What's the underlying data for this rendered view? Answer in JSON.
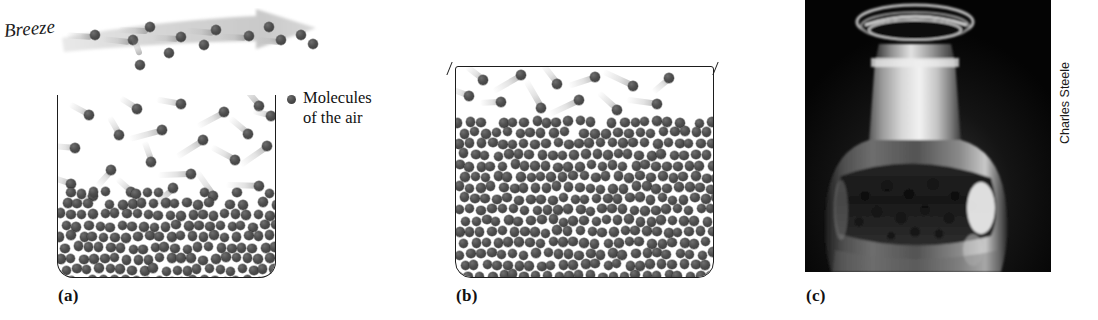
{
  "figure": {
    "background_color": "#ffffff",
    "molecule_color": "#4a4a4a",
    "outline_color": "#1d1d1d",
    "trail_color": "#b4b4b4"
  },
  "breeze": {
    "label": "Breeze",
    "arrow_direction": "right",
    "arrow_color": "#d2d2d2"
  },
  "legend": {
    "marker": "molecule-dot",
    "text": "Molecules\nof the air"
  },
  "panels": [
    {
      "id": "a",
      "label": "(a)",
      "container_state": "open",
      "liquid_fill_percent": 48,
      "description": "Open container in a breeze; molecules escape and are carried away"
    },
    {
      "id": "b",
      "label": "(b)",
      "container_state": "closed",
      "liquid_fill_percent": 86,
      "description": "Closed container; molecules escape and return, reaching equilibrium"
    },
    {
      "id": "c",
      "label": "(c)",
      "container_state": "photograph",
      "description": "Photograph of a stoppered glass bottle containing liquid"
    }
  ],
  "photo": {
    "credit": "Charles Steele",
    "background_color": "#060606",
    "subject": "glass bottle with stopper"
  },
  "particles": {
    "panel_a_vapor": [
      {
        "x": 26,
        "y": 15,
        "a": 118
      },
      {
        "x": 74,
        "y": 9,
        "a": 122
      },
      {
        "x": 118,
        "y": 4,
        "a": 100
      },
      {
        "x": 161,
        "y": 12,
        "a": 62
      },
      {
        "x": 196,
        "y": 6,
        "a": 140
      },
      {
        "x": 12,
        "y": 48,
        "a": 95
      },
      {
        "x": 56,
        "y": 35,
        "a": 150
      },
      {
        "x": 99,
        "y": 30,
        "a": 75
      },
      {
        "x": 140,
        "y": 40,
        "a": 58
      },
      {
        "x": 185,
        "y": 34,
        "a": 130
      },
      {
        "x": 8,
        "y": 84,
        "a": 108
      },
      {
        "x": 48,
        "y": 70,
        "a": 42
      },
      {
        "x": 88,
        "y": 62,
        "a": 160
      },
      {
        "x": 128,
        "y": 74,
        "a": 88
      },
      {
        "x": 172,
        "y": 60,
        "a": 118
      },
      {
        "x": 204,
        "y": 46,
        "a": 55
      },
      {
        "x": 30,
        "y": 96,
        "a": 70
      },
      {
        "x": 68,
        "y": 92,
        "a": 132
      },
      {
        "x": 110,
        "y": 88,
        "a": 48
      },
      {
        "x": 150,
        "y": 96,
        "a": 145
      },
      {
        "x": 196,
        "y": 86,
        "a": 92
      },
      {
        "x": 208,
        "y": 16,
        "a": 105
      }
    ],
    "panel_b_vapor": [
      {
        "x": 22,
        "y": 8,
        "a": 128
      },
      {
        "x": 60,
        "y": 3,
        "a": 60
      },
      {
        "x": 96,
        "y": 12,
        "a": 142
      },
      {
        "x": 134,
        "y": 5,
        "a": 72
      },
      {
        "x": 172,
        "y": 14,
        "a": 115
      },
      {
        "x": 208,
        "y": 6,
        "a": 50
      },
      {
        "x": 40,
        "y": 30,
        "a": 88
      },
      {
        "x": 80,
        "y": 36,
        "a": 150
      },
      {
        "x": 118,
        "y": 28,
        "a": 65
      },
      {
        "x": 156,
        "y": 38,
        "a": 132
      },
      {
        "x": 196,
        "y": 32,
        "a": 98
      },
      {
        "x": 8,
        "y": 24,
        "a": 110
      }
    ]
  },
  "geometry": {
    "panel_a": {
      "left": 57,
      "top": 95,
      "width": 219,
      "height": 183,
      "liquid_top": 190
    },
    "panel_b": {
      "left": 455,
      "top": 66,
      "width": 259,
      "height": 212,
      "liquid_top": 120
    },
    "molecule_diameter": 9.5,
    "liquid_rows_spacing": 11
  }
}
